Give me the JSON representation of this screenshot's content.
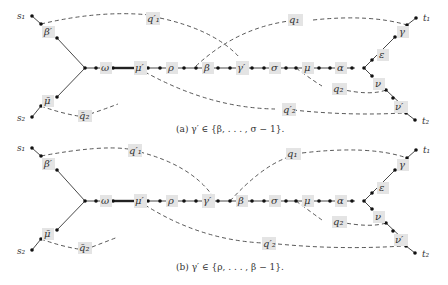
{
  "figure": {
    "panels": [
      {
        "id": "a",
        "caption": "(a) γ′ ∈ {β, . . . , σ − 1}.",
        "terminals": {
          "s1": "s₁",
          "s2": "s₂",
          "t1": "t₁",
          "t2": "t₂"
        },
        "labels": {
          "beta_prime": "β′",
          "mu_bar": "μ̄",
          "omega": "ω",
          "mu_prime": "μ′",
          "rho": "ρ",
          "beta": "β",
          "gamma_prime": "γ′",
          "sigma": "σ",
          "mu": "μ",
          "alpha": "α",
          "epsilon": "ε",
          "gamma": "γ",
          "nu": "ν",
          "nu_prime": "ν′",
          "q1_prime": "q′₁",
          "q1": "q₁",
          "q2": "q₂",
          "q2_prime": "q′₂",
          "q2_bar": "q̄₂"
        }
      },
      {
        "id": "b",
        "caption": "(b) γ′ ∈ {ρ, . . . , β − 1}.",
        "terminals": {
          "s1": "s₁",
          "s2": "s₂",
          "t1": "t₁",
          "t2": "t₂"
        },
        "labels": {
          "beta_prime": "β′",
          "mu_bar": "μ̄",
          "omega": "ω",
          "mu_prime": "μ′",
          "rho": "ρ",
          "gamma_prime": "γ′",
          "beta": "β",
          "sigma": "σ",
          "mu": "μ",
          "alpha": "α",
          "epsilon": "ε",
          "gamma": "γ",
          "nu": "ν",
          "nu_prime": "ν′",
          "q1_prime": "q′₁",
          "q1": "q₁",
          "q2": "q₂",
          "q2_prime": "q′₂",
          "q2_bar": "q̄₂"
        }
      }
    ],
    "colors": {
      "label_bg": "#e4e4e4",
      "ink": "#333333"
    }
  }
}
